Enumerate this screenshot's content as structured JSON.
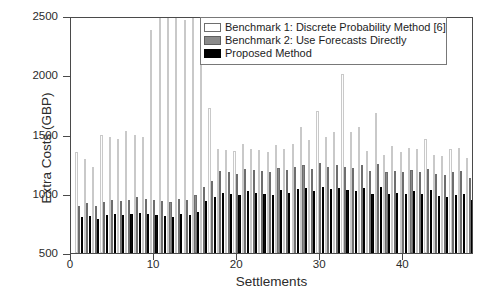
{
  "chart_data": {
    "type": "bar",
    "title": "",
    "xlabel": "Settlements",
    "ylabel": "Extra Costs (GBP)",
    "xlim": [
      0,
      48.5
    ],
    "ylim": [
      500,
      2500
    ],
    "ytick_values": [
      500,
      1000,
      1500,
      2000,
      2500
    ],
    "ytick_labels": [
      "500",
      "1000",
      "1500",
      "2000",
      "2500"
    ],
    "xtick_values": [
      0,
      10,
      20,
      30,
      40
    ],
    "xtick_labels": [
      "0",
      "10",
      "20",
      "30",
      "40"
    ],
    "grid": false,
    "legend_position": "top-right",
    "categories": [
      1,
      2,
      3,
      4,
      5,
      6,
      7,
      8,
      9,
      10,
      11,
      12,
      13,
      14,
      15,
      16,
      17,
      18,
      19,
      20,
      21,
      22,
      23,
      24,
      25,
      26,
      27,
      28,
      29,
      30,
      31,
      32,
      33,
      34,
      35,
      36,
      37,
      38,
      39,
      40,
      41,
      42,
      43,
      44,
      45,
      46,
      47,
      48
    ],
    "series": [
      {
        "name": "Benchmark 1: Discrete Probability Method [6]",
        "color": "#ffffff",
        "values": [
          1350,
          1290,
          1230,
          1500,
          1480,
          1460,
          1530,
          1500,
          1480,
          2380,
          2600,
          2660,
          2620,
          2470,
          2480,
          2300,
          1720,
          1380,
          1370,
          1360,
          1420,
          1380,
          1370,
          1350,
          1410,
          1380,
          1420,
          1560,
          1450,
          1700,
          1480,
          1520,
          2010,
          1520,
          1560,
          1360,
          1680,
          1330,
          1400,
          1350,
          1390,
          1380,
          1460,
          1330,
          1320,
          1380,
          1390,
          1300
        ]
      },
      {
        "name": "Benchmark 2: Use Forecasts Directly",
        "color": "#8a8a8a",
        "values": [
          900,
          920,
          900,
          930,
          950,
          940,
          950,
          970,
          960,
          950,
          940,
          930,
          960,
          950,
          990,
          1060,
          1110,
          1190,
          1180,
          1170,
          1210,
          1200,
          1190,
          1180,
          1220,
          1200,
          1230,
          1240,
          1210,
          1260,
          1230,
          1240,
          1230,
          1220,
          1240,
          1190,
          1250,
          1180,
          1190,
          1180,
          1200,
          1180,
          1210,
          1170,
          1160,
          1180,
          1190,
          1130
        ]
      },
      {
        "name": "Proposed Method",
        "color": "#000000",
        "values": [
          800,
          810,
          790,
          820,
          830,
          820,
          830,
          840,
          830,
          820,
          810,
          800,
          830,
          820,
          850,
          940,
          970,
          1010,
          1000,
          990,
          1020,
          1010,
          1000,
          990,
          1030,
          1010,
          1040,
          1050,
          1020,
          1060,
          1040,
          1050,
          1030,
          1020,
          1050,
          1000,
          1060,
          1000,
          1010,
          1000,
          1020,
          1000,
          1030,
          980,
          970,
          990,
          1000,
          950
        ]
      }
    ]
  },
  "legend": {
    "items": [
      {
        "label": "Benchmark 1: Discrete Probability Method [6]",
        "swatch": "white-swatch"
      },
      {
        "label": "Benchmark 2: Use Forecasts Directly",
        "swatch": "gray-swatch"
      },
      {
        "label": "Proposed Method",
        "swatch": "black-swatch"
      }
    ]
  }
}
